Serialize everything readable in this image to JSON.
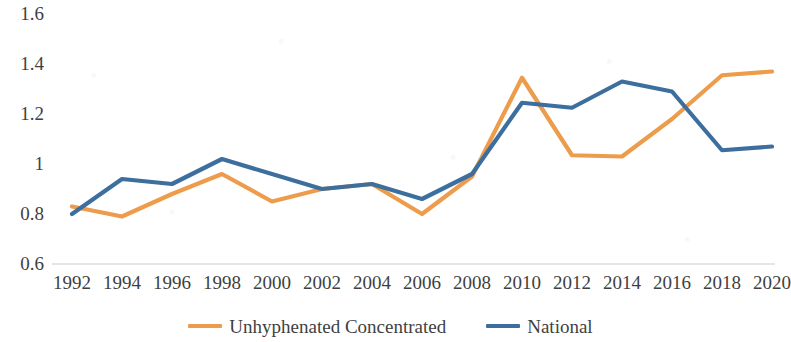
{
  "chart_data": {
    "type": "line",
    "title": "",
    "xlabel": "",
    "ylabel": "",
    "x": [
      1992,
      1994,
      1996,
      1998,
      2000,
      2002,
      2004,
      2006,
      2008,
      2010,
      2012,
      2014,
      2016,
      2018,
      2020
    ],
    "xtick_labels": [
      "1992",
      "1994",
      "1996",
      "1998",
      "2000",
      "2002",
      "2004",
      "2006",
      "2008",
      "2010",
      "2012",
      "2014",
      "2016",
      "2018",
      "2020"
    ],
    "ytick_labels": [
      "1.6",
      "1.4",
      "1.2",
      "1",
      "0.8",
      "0.6"
    ],
    "ytick_values": [
      1.6,
      1.4,
      1.2,
      1.0,
      0.8,
      0.6
    ],
    "ylim": [
      0.6,
      1.6
    ],
    "xlim": [
      1992,
      2020
    ],
    "grid": false,
    "axis_line": "x-axis baseline only at y = 0.6",
    "legend_position": "bottom-center",
    "series": [
      {
        "name": "Unhyphenated Concentrated",
        "color": "#ED9C4B",
        "values": [
          0.83,
          0.79,
          0.88,
          0.96,
          0.85,
          0.9,
          0.92,
          0.8,
          0.95,
          1.345,
          1.035,
          1.03,
          1.18,
          1.355,
          1.37
        ]
      },
      {
        "name": "National",
        "color": "#3C6E9E",
        "values": [
          0.8,
          0.94,
          0.92,
          1.02,
          0.96,
          0.9,
          0.92,
          0.86,
          0.96,
          1.245,
          1.225,
          1.33,
          1.29,
          1.055,
          1.07
        ]
      }
    ]
  },
  "legend": {
    "items": [
      {
        "label": "Unhyphenated Concentrated",
        "color": "#ED9C4B",
        "marker": "line-swatch"
      },
      {
        "label": "National",
        "color": "#3C6E9E",
        "marker": "line-swatch"
      }
    ]
  },
  "colors": {
    "series_unhyphenated_concentrated": "#ED9C4B",
    "series_national": "#3C6E9E",
    "text": "#3f3f3f",
    "axis_line": "#d9d9d9",
    "background": "#ffffff"
  }
}
